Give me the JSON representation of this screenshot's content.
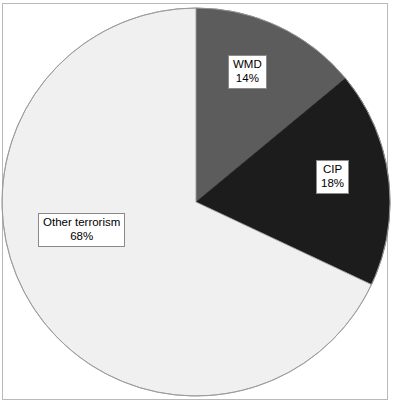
{
  "figure": {
    "background_color": "#ffffff",
    "frame_color": "#b9b9b9"
  },
  "chart_data": {
    "type": "pie",
    "title": "",
    "subtitle": "",
    "xlabel": "",
    "ylabel": "",
    "legend_position": "none",
    "grid": false,
    "start_angle_deg": 0,
    "direction": "clockwise",
    "categories": [
      "WMD",
      "CIP",
      "Other terrorism"
    ],
    "values": [
      14,
      18,
      68
    ],
    "unit": "%",
    "colors": [
      "#5c5c5c",
      "#1c1c1c",
      "#f0f0f0"
    ],
    "slices": [
      {
        "label": "WMD",
        "value": 14,
        "value_text": "14%",
        "color": "#5c5c5c",
        "start_deg": 0,
        "end_deg": 50.4
      },
      {
        "label": "CIP",
        "value": 18,
        "value_text": "18%",
        "color": "#1c1c1c",
        "start_deg": 50.4,
        "end_deg": 115.2
      },
      {
        "label": "Other terrorism",
        "value": 68,
        "value_text": "68%",
        "color": "#f0f0f0",
        "start_deg": 115.2,
        "end_deg": 360
      }
    ],
    "annotations": [
      {
        "text": "WMD",
        "value_text": "14%"
      },
      {
        "text": "CIP",
        "value_text": "18%"
      },
      {
        "text": "Other terrorism",
        "value_text": "68%"
      }
    ]
  }
}
